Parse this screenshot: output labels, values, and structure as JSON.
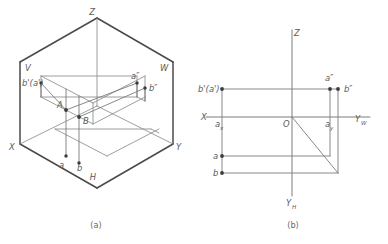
{
  "figure": {
    "title_a": "(a)",
    "title_b": "(b)"
  },
  "diagram_a": {
    "caption": "(a)",
    "plane_labels": [
      {
        "name": "V",
        "text": "V"
      },
      {
        "name": "W",
        "text": "W"
      },
      {
        "name": "H",
        "text": "H"
      }
    ],
    "axis_labels": [
      {
        "name": "Z",
        "text": "Z"
      },
      {
        "name": "X",
        "text": "X"
      },
      {
        "name": "Y",
        "text": "Y"
      }
    ],
    "point_labels": [
      {
        "name": "bprime-aprime",
        "text": "b'(a')"
      },
      {
        "name": "a-doubleprime",
        "text": "a″"
      },
      {
        "name": "b-doubleprime",
        "text": "b″"
      },
      {
        "name": "A",
        "text": "A"
      },
      {
        "name": "B",
        "text": "B"
      },
      {
        "name": "a",
        "text": "a"
      },
      {
        "name": "b",
        "text": "b"
      }
    ]
  },
  "diagram_b": {
    "caption": "(b)",
    "axis_labels": [
      {
        "name": "Z",
        "text": "Z"
      },
      {
        "name": "X",
        "text": "X"
      },
      {
        "name": "YW",
        "text": "Y",
        "sub": "W"
      },
      {
        "name": "YH",
        "text": "Y",
        "sub": "H"
      },
      {
        "name": "O",
        "text": "O"
      }
    ],
    "point_labels": [
      {
        "name": "bprime-aprime",
        "text": "b'(a')"
      },
      {
        "name": "a-doubleprime",
        "text": "a″"
      },
      {
        "name": "b-doubleprime",
        "text": "b″"
      },
      {
        "name": "a",
        "text": "a"
      },
      {
        "name": "b",
        "text": "b"
      },
      {
        "name": "ax",
        "text": "a",
        "sub": "x"
      },
      {
        "name": "ay",
        "text": "a",
        "sub": "y"
      }
    ]
  },
  "colors": {
    "edge_thick": "#4a4a4a",
    "edge_thin": "#8d8d8d",
    "axis": "#7d7d7d",
    "point": "#3b3b3b",
    "label": "#5b5b5b",
    "caption": "#6a6a6a",
    "background": "#ffffff"
  }
}
